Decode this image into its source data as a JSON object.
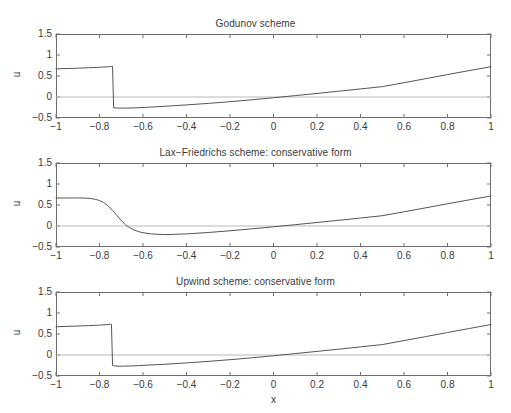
{
  "figure": {
    "width": 511,
    "height": 413,
    "background": "#ffffff",
    "axis_color": "#6f6f6f",
    "curve_color": "#555555",
    "zeroline_color": "#b9b9b9",
    "text_color": "#3a3a3a"
  },
  "axis": {
    "xlabel": "x",
    "ylabel": "u",
    "xlim": [
      -1,
      1
    ],
    "ylim": [
      -0.5,
      1.5
    ],
    "xticks": [
      -1,
      -0.8,
      -0.6,
      -0.4,
      -0.2,
      0,
      0.2,
      0.4,
      0.6,
      0.8,
      1
    ],
    "xtick_labels": [
      "−1",
      "−0.8",
      "−0.6",
      "−0.4",
      "−0.2",
      "0",
      "0.2",
      "0.4",
      "0.6",
      "0.8",
      "1"
    ],
    "yticks": [
      -0.5,
      0,
      0.5,
      1,
      1.5
    ],
    "ytick_labels": [
      "−0.5",
      "0",
      "0.5",
      "1",
      "1.5"
    ],
    "grid": false,
    "legend": "none"
  },
  "chart_data": {
    "type": "line",
    "xlabel": "x",
    "ylabel": "u",
    "xlim": [
      -1,
      1
    ],
    "ylim": [
      -0.5,
      1.5
    ],
    "xticks": [
      -1,
      -0.8,
      -0.6,
      -0.4,
      -0.2,
      0,
      0.2,
      0.4,
      0.6,
      0.8,
      1
    ],
    "yticks": [
      -0.5,
      0,
      0.5,
      1,
      1.5
    ],
    "grid": false,
    "legend": "none",
    "panels": [
      {
        "title": "Godunov scheme",
        "series": [
          {
            "name": "zero reference",
            "style": "solid",
            "color": "#b9b9b9",
            "x": [
              -1,
              1
            ],
            "y": [
              0,
              0
            ]
          },
          {
            "name": "Godunov solution",
            "style": "solid",
            "color": "#555555",
            "shock_x": -0.74,
            "left_plateau": [
              0.67,
              0.73
            ],
            "post_shock_min": -0.26,
            "zero_crossing_x": -0.15,
            "right_end": 0.72,
            "x": [
              -1.0,
              -0.95,
              -0.9,
              -0.85,
              -0.8,
              -0.76,
              -0.745,
              -0.74,
              -0.735,
              -0.72,
              -0.7,
              -0.68,
              -0.64,
              -0.6,
              -0.55,
              -0.5,
              -0.4,
              -0.3,
              -0.2,
              -0.15,
              -0.1,
              0.0,
              0.1,
              0.2,
              0.3,
              0.4,
              0.5,
              0.6,
              0.7,
              0.8,
              0.9,
              1.0
            ],
            "y": [
              0.67,
              0.678,
              0.687,
              0.697,
              0.708,
              0.72,
              0.727,
              0.73,
              -0.255,
              -0.262,
              -0.265,
              -0.264,
              -0.259,
              -0.25,
              -0.236,
              -0.221,
              -0.188,
              -0.152,
              -0.112,
              -0.09,
              -0.067,
              -0.018,
              0.033,
              0.085,
              0.138,
              0.192,
              0.247,
              0.341,
              0.437,
              0.534,
              0.629,
              0.722
            ]
          }
        ]
      },
      {
        "title": "Lax−Friedrichs scheme: conservative form",
        "series": [
          {
            "name": "zero reference",
            "style": "solid",
            "color": "#b9b9b9",
            "x": [
              -1,
              1
            ],
            "y": [
              0,
              0
            ]
          },
          {
            "name": "Lax-Friedrichs solution",
            "style": "solid",
            "color": "#555555",
            "shock_x": -0.76,
            "left_plateau": [
              0.665,
              0.672
            ],
            "post_shock_min": -0.215,
            "zero_crossing_x": -0.15,
            "right_end": 0.715,
            "smeared": true,
            "x": [
              -1.0,
              -0.95,
              -0.9,
              -0.88,
              -0.86,
              -0.84,
              -0.82,
              -0.8,
              -0.78,
              -0.76,
              -0.74,
              -0.72,
              -0.7,
              -0.68,
              -0.66,
              -0.64,
              -0.62,
              -0.6,
              -0.56,
              -0.5,
              -0.4,
              -0.3,
              -0.2,
              -0.15,
              -0.1,
              0.0,
              0.1,
              0.2,
              0.3,
              0.4,
              0.5,
              0.6,
              0.7,
              0.8,
              0.9,
              1.0
            ],
            "y": [
              0.665,
              0.667,
              0.668,
              0.667,
              0.663,
              0.654,
              0.637,
              0.607,
              0.556,
              0.478,
              0.372,
              0.25,
              0.13,
              0.03,
              -0.045,
              -0.098,
              -0.135,
              -0.16,
              -0.19,
              -0.205,
              -0.188,
              -0.155,
              -0.113,
              -0.091,
              -0.068,
              -0.019,
              0.032,
              0.083,
              0.136,
              0.19,
              0.245,
              0.338,
              0.433,
              0.529,
              0.623,
              0.715
            ]
          }
        ]
      },
      {
        "title": "Upwind scheme: conservative form",
        "series": [
          {
            "name": "zero reference",
            "style": "solid",
            "color": "#b9b9b9",
            "x": [
              -1,
              1
            ],
            "y": [
              0,
              0
            ]
          },
          {
            "name": "Upwind solution",
            "style": "solid",
            "color": "#555555",
            "shock_x": -0.745,
            "left_plateau": [
              0.672,
              0.732
            ],
            "post_shock_min": -0.262,
            "zero_crossing_x": -0.15,
            "right_end": 0.725,
            "x": [
              -1.0,
              -0.95,
              -0.9,
              -0.85,
              -0.8,
              -0.77,
              -0.75,
              -0.745,
              -0.74,
              -0.73,
              -0.71,
              -0.69,
              -0.66,
              -0.62,
              -0.58,
              -0.5,
              -0.4,
              -0.3,
              -0.2,
              -0.15,
              -0.1,
              0.0,
              0.1,
              0.2,
              0.3,
              0.4,
              0.5,
              0.6,
              0.7,
              0.8,
              0.9,
              1.0
            ],
            "y": [
              0.672,
              0.681,
              0.69,
              0.7,
              0.711,
              0.722,
              0.73,
              0.732,
              -0.25,
              -0.26,
              -0.266,
              -0.266,
              -0.261,
              -0.252,
              -0.241,
              -0.221,
              -0.188,
              -0.152,
              -0.112,
              -0.09,
              -0.067,
              -0.018,
              0.034,
              0.086,
              0.139,
              0.193,
              0.248,
              0.343,
              0.438,
              0.535,
              0.631,
              0.725
            ]
          }
        ]
      }
    ]
  }
}
